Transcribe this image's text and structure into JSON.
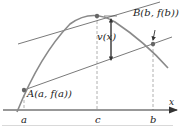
{
  "figure": {
    "type": "mean-value-theorem-diagram",
    "colors": {
      "curve": "#8a8a8a",
      "lines": "#7a7a7a",
      "axis": "#333333",
      "dashed": "#b0b0b0",
      "point": "#666666"
    },
    "labels": {
      "point_a": "A(a, f(a))",
      "point_b": "B(b, f(b))",
      "vertical_distance": "v(x)",
      "x_axis": "x",
      "tick_a": "a",
      "tick_c": "c",
      "tick_b": "b"
    }
  }
}
